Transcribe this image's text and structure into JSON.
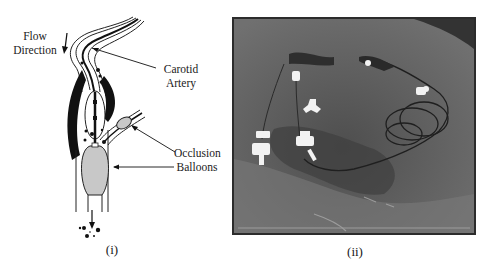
{
  "figure": {
    "panel_i": {
      "caption": "(i)",
      "labels": {
        "flow_line1": "Flow",
        "flow_line2": "Direction",
        "carotid_line1": "Carotid",
        "carotid_line2": "Artery",
        "occlusion_line1": "Occlusion",
        "occlusion_line2": "Balloons"
      },
      "icons": [
        "flow-arrow-icon",
        "carotid-artery-diagram",
        "occlusion-balloon-large",
        "occlusion-balloon-small",
        "debris-particles"
      ]
    },
    "panel_ii": {
      "caption": "(ii)",
      "description": "grayscale photograph of a phantom vessel model with catheters and connectors"
    },
    "colors": {
      "plaque": "#111111",
      "balloon": "#c8c8c8",
      "photo_bg": "#5e5e5e",
      "photo_border": "#2c2c2c"
    }
  }
}
